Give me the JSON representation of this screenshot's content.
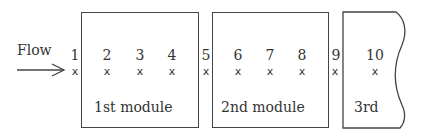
{
  "flow": {
    "label": "Flow"
  },
  "modules": [
    {
      "label": "1st module"
    },
    {
      "label": "2nd module"
    },
    {
      "label": "3rd"
    }
  ],
  "points": [
    "1",
    "2",
    "3",
    "4",
    "5",
    "6",
    "7",
    "8",
    "9",
    "10"
  ],
  "marker": "x"
}
